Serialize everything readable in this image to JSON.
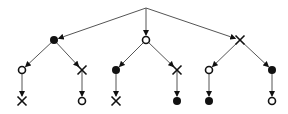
{
  "diagram": {
    "type": "tree",
    "colors": {
      "edge": "#555555",
      "node": "#111111",
      "background": "#ffffff"
    },
    "nodes": [
      {
        "id": "root",
        "kind": "none",
        "x": 146,
        "y": 8
      },
      {
        "id": "a",
        "kind": "filled",
        "x": 54,
        "y": 40
      },
      {
        "id": "b",
        "kind": "open",
        "x": 146,
        "y": 40
      },
      {
        "id": "c",
        "kind": "cross",
        "x": 240,
        "y": 40
      },
      {
        "id": "a1",
        "kind": "open",
        "x": 22,
        "y": 70
      },
      {
        "id": "a2",
        "kind": "cross",
        "x": 82,
        "y": 70
      },
      {
        "id": "b1",
        "kind": "filled",
        "x": 116,
        "y": 70
      },
      {
        "id": "b2",
        "kind": "cross",
        "x": 177,
        "y": 70
      },
      {
        "id": "c1",
        "kind": "open",
        "x": 209,
        "y": 70
      },
      {
        "id": "c2",
        "kind": "filled",
        "x": 272,
        "y": 70
      },
      {
        "id": "a1x",
        "kind": "cross",
        "x": 22,
        "y": 101
      },
      {
        "id": "a2x",
        "kind": "open",
        "x": 82,
        "y": 101
      },
      {
        "id": "b1x",
        "kind": "cross",
        "x": 116,
        "y": 101
      },
      {
        "id": "b2x",
        "kind": "filled",
        "x": 177,
        "y": 101
      },
      {
        "id": "c1x",
        "kind": "filled",
        "x": 209,
        "y": 101
      },
      {
        "id": "c2x",
        "kind": "open",
        "x": 272,
        "y": 101
      }
    ],
    "edges": [
      [
        "root",
        "a"
      ],
      [
        "root",
        "b"
      ],
      [
        "root",
        "c"
      ],
      [
        "a",
        "a1"
      ],
      [
        "a",
        "a2"
      ],
      [
        "b",
        "b1"
      ],
      [
        "b",
        "b2"
      ],
      [
        "c",
        "c1"
      ],
      [
        "c",
        "c2"
      ],
      [
        "a1",
        "a1x"
      ],
      [
        "a2",
        "a2x"
      ],
      [
        "b1",
        "b1x"
      ],
      [
        "b2",
        "b2x"
      ],
      [
        "c1",
        "c1x"
      ],
      [
        "c2",
        "c2x"
      ]
    ]
  }
}
